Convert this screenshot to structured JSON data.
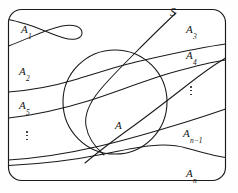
{
  "figure": {
    "kind": "set-partition-venn-diagram",
    "universe_label": "S",
    "event_label": "A",
    "caption": "",
    "colors": {
      "stroke": "#1a1a1a",
      "background": "#ffffff"
    },
    "labels": [
      {
        "name": "label-a1",
        "base": "A",
        "sub": "1",
        "x": 21,
        "y": 24
      },
      {
        "name": "label-a2",
        "base": "A",
        "sub": "2",
        "x": 19,
        "y": 66
      },
      {
        "name": "label-a5",
        "base": "A",
        "sub": "5",
        "x": 19,
        "y": 100
      },
      {
        "name": "label-a3",
        "base": "A",
        "sub": "3",
        "x": 186,
        "y": 24
      },
      {
        "name": "label-a4",
        "base": "A",
        "sub": "4",
        "x": 186,
        "y": 50
      },
      {
        "name": "label-an1",
        "base": "A",
        "sub": "n−1",
        "x": 183,
        "y": 128
      },
      {
        "name": "label-an",
        "base": "A",
        "sub": "n",
        "x": 186,
        "y": 168
      },
      {
        "name": "label-a",
        "base": "A",
        "sub": "",
        "x": 115,
        "y": 120
      },
      {
        "name": "label-s",
        "base": "S",
        "sub": "",
        "x": 170,
        "y": 7
      }
    ],
    "ellipsis_marks": [
      {
        "name": "vertical-dots-left",
        "x": 24,
        "y": 131
      },
      {
        "name": "vertical-dots-right",
        "x": 188,
        "y": 86
      }
    ],
    "geometry": {
      "outer_rect": {
        "x": 8,
        "y": 9,
        "width": 218,
        "height": 172,
        "radius": 13
      },
      "circle": {
        "cx": 115,
        "cy": 102,
        "r": 52
      }
    }
  }
}
